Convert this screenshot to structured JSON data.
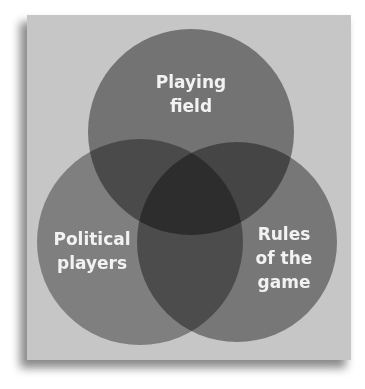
{
  "diagram": {
    "type": "venn",
    "circles": [
      {
        "id": "top",
        "label_lines": [
          "Playing",
          "field"
        ],
        "color": "#6e6e6e"
      },
      {
        "id": "left",
        "label_lines": [
          "Political",
          "players"
        ],
        "color": "#7d7d7d"
      },
      {
        "id": "right",
        "label_lines": [
          "Rules",
          "of the",
          "game"
        ],
        "color": "#737373"
      }
    ],
    "colors": {
      "panel_background": "#c6c6c6",
      "double_overlap": "#5f5f5f",
      "triple_overlap": "#4a4a4a",
      "label_text": "#f2f2f2"
    }
  }
}
